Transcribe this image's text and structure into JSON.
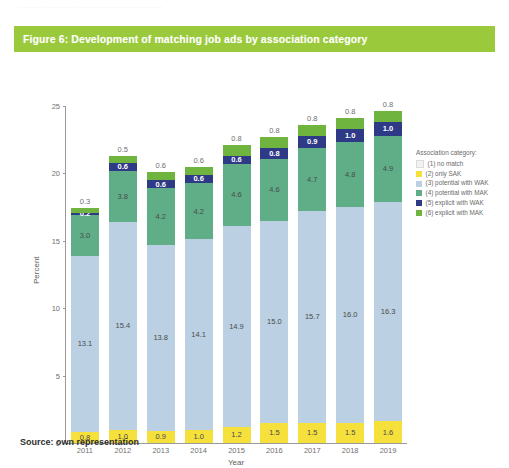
{
  "top_remnant": "..................................................",
  "figure": {
    "caption": "Figure 6: Development of matching job ads by association category",
    "banner_color": "#9ACA3C"
  },
  "source": {
    "text": "Source: own representation"
  },
  "legend": {
    "title": "Association category:",
    "items": [
      {
        "label": "(1) no match",
        "color": "#F2F2F2"
      },
      {
        "label": "(2) only SAK",
        "color": "#F5E03C"
      },
      {
        "label": "(3) potential with WAK",
        "color": "#BBD1E3"
      },
      {
        "label": "(4) potential with MAK",
        "color": "#5FAE88"
      },
      {
        "label": "(5) explicit with WAK",
        "color": "#2F3A87"
      },
      {
        "label": "(6) explicit with MAK",
        "color": "#6FB43F"
      }
    ]
  },
  "chart_data": {
    "type": "bar",
    "stacked": true,
    "title": "Development of matching job ads by association category",
    "xlabel": "Year",
    "ylabel": "Percent",
    "ylim": [
      0,
      25
    ],
    "yticks": [
      0,
      5,
      10,
      15,
      20,
      25
    ],
    "grid": false,
    "legend_position": "right",
    "categories": [
      "2011",
      "2012",
      "2013",
      "2014",
      "2015",
      "2016",
      "2017",
      "2018",
      "2019"
    ],
    "series": [
      {
        "name": "(2) only SAK",
        "color": "#F5E03C",
        "values": [
          0.8,
          1.0,
          0.9,
          1.0,
          1.2,
          1.5,
          1.5,
          1.5,
          1.6
        ]
      },
      {
        "name": "(3) potential with WAK",
        "color": "#BBD1E3",
        "values": [
          13.1,
          15.4,
          13.8,
          14.1,
          14.9,
          15.0,
          15.7,
          16.0,
          16.3
        ]
      },
      {
        "name": "(4) potential with MAK",
        "color": "#5FAE88",
        "values": [
          3.0,
          3.8,
          4.2,
          4.2,
          4.6,
          4.6,
          4.7,
          4.8,
          4.9
        ]
      },
      {
        "name": "(5) explicit with WAK",
        "color": "#2F3A87",
        "values": [
          0.2,
          0.6,
          0.6,
          0.6,
          0.6,
          0.8,
          0.9,
          1.0,
          1.0
        ]
      },
      {
        "name": "(6) explicit with MAK",
        "color": "#6FB43F",
        "values": [
          0.3,
          0.5,
          0.6,
          0.6,
          0.8,
          0.8,
          0.8,
          0.8,
          0.8
        ]
      }
    ]
  }
}
